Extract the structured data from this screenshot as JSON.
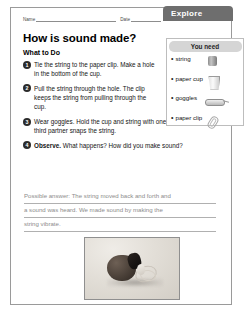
{
  "tab": {
    "label": "Explore"
  },
  "form": {
    "name_label": "Name",
    "date_label": "Date"
  },
  "page": {
    "title": "How is sound made?",
    "subtitle": "What to Do"
  },
  "steps": [
    {
      "number": "1",
      "text": "Tie the string to the paper clip. Make a hole in the bottom of the cup."
    },
    {
      "number": "2",
      "text": "Pull the string through the hole. The clip keeps the string from pulling through the cup."
    },
    {
      "number": "3",
      "text": "Wear goggles. Hold the cup and string with one partner. The third partner snaps the string."
    },
    {
      "number": "4",
      "bold_lead": "Observe.",
      "text": "What happens? How did you make sound?"
    }
  ],
  "answer": {
    "lines": [
      "Possible answer: The string moved back and forth and",
      "a sound was heard. We made sound by making the",
      "string vibrate."
    ]
  },
  "you_need": {
    "header": "You need",
    "items": [
      {
        "label": "string",
        "icon": "string-spool-icon"
      },
      {
        "label": "paper cup",
        "icon": "paper-cup-icon"
      },
      {
        "label": "goggles",
        "icon": "goggles-icon"
      },
      {
        "label": "paper clip",
        "icon": "paper-clip-icon"
      }
    ]
  },
  "photo": {
    "caption": "",
    "alt_name": "cup-with-string-photo"
  },
  "colors": {
    "tab_bg": "#6e6e6e",
    "need_header_bg": "#d5d5d5",
    "step_bullet_bg": "#2b2b2b",
    "answer_text": "#8c8c8c",
    "page_border": "#9a9a9a"
  }
}
